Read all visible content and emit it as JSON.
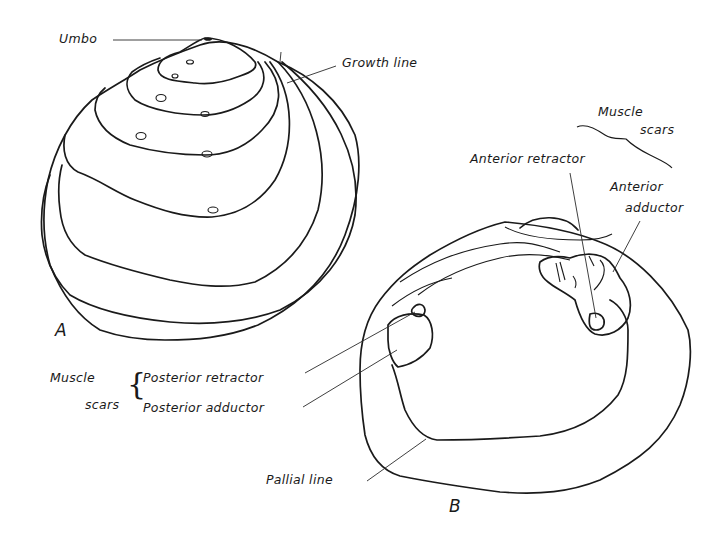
{
  "figure": {
    "panels": [
      {
        "id": "A",
        "letter": "A",
        "subject": "Exterior of shell valve",
        "labels": {
          "umbo": "Umbo",
          "growth_line": "Growth line"
        }
      },
      {
        "id": "B",
        "letter": "B",
        "subject": "Interior of shell valve",
        "labels": {
          "muscle_scars_top_line1": "Muscle",
          "muscle_scars_top_line2": "scars",
          "anterior_retractor": "Anterior retractor",
          "anterior_adductor_line1": "Anterior",
          "anterior_adductor_line2": "adductor",
          "muscle_scars_left_line1": "Muscle",
          "muscle_scars_left_line2": "scars",
          "posterior_retractor": "Posterior retractor",
          "posterior_adductor": "Posterior adductor",
          "pallial_line": "Pallial line"
        }
      }
    ],
    "colors": {
      "ink": "#1a1a1a",
      "paper": "#ffffff"
    }
  }
}
